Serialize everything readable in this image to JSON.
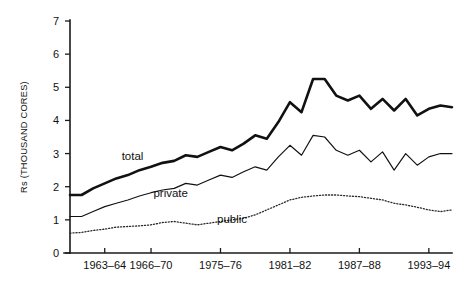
{
  "chart_data": {
    "type": "line",
    "title": "",
    "subtitle": "",
    "xlabel": "",
    "ylabel": "Rs (THOUSAND CORES)",
    "ylim": [
      0,
      7
    ],
    "yticks": [
      0,
      1,
      2,
      3,
      4,
      5,
      6,
      7
    ],
    "ytick_labels": [
      "0",
      "1",
      "2",
      "3",
      "4",
      "5",
      "6",
      "7"
    ],
    "xlim": [
      0,
      33
    ],
    "xtick_positions": [
      3,
      7,
      13,
      19,
      25,
      31
    ],
    "xtick_labels": [
      "1963–64",
      "1966–70",
      "1975–76",
      "1981–82",
      "1987–88",
      "1993–94"
    ],
    "grid": false,
    "legend_position": "inline-annotations",
    "annotations": [
      {
        "text": "total",
        "x": 5.4,
        "y": 2.82
      },
      {
        "text": "private",
        "x": 8.7,
        "y": 1.68
      },
      {
        "text": "public",
        "x": 14.0,
        "y": 0.92
      }
    ],
    "series": [
      {
        "name": "total",
        "style": "thick-solid",
        "color": "#111111",
        "x": [
          0,
          1,
          2,
          3,
          4,
          5,
          6,
          7,
          8,
          9,
          10,
          11,
          12,
          13,
          14,
          15,
          16,
          17,
          18,
          19,
          20,
          21,
          22,
          23,
          24,
          25,
          26,
          27,
          28,
          29,
          30,
          31,
          32,
          33
        ],
        "values": [
          1.75,
          1.75,
          1.95,
          2.1,
          2.25,
          2.35,
          2.5,
          2.6,
          2.72,
          2.78,
          2.95,
          2.9,
          3.05,
          3.2,
          3.1,
          3.3,
          3.55,
          3.45,
          3.95,
          4.55,
          4.25,
          5.25,
          5.25,
          4.75,
          4.6,
          4.75,
          4.35,
          4.65,
          4.3,
          4.65,
          4.15,
          4.35,
          4.45,
          4.4
        ]
      },
      {
        "name": "private",
        "style": "thin-solid",
        "color": "#111111",
        "x": [
          0,
          1,
          2,
          3,
          4,
          5,
          6,
          7,
          8,
          9,
          10,
          11,
          12,
          13,
          14,
          15,
          16,
          17,
          18,
          19,
          20,
          21,
          22,
          23,
          24,
          25,
          26,
          27,
          28,
          29,
          30,
          31,
          32,
          33
        ],
        "values": [
          1.1,
          1.1,
          1.25,
          1.4,
          1.5,
          1.6,
          1.72,
          1.82,
          1.9,
          1.95,
          2.1,
          2.05,
          2.2,
          2.35,
          2.28,
          2.45,
          2.6,
          2.5,
          2.9,
          3.25,
          2.95,
          3.55,
          3.5,
          3.1,
          2.95,
          3.1,
          2.75,
          3.05,
          2.5,
          3.0,
          2.65,
          2.9,
          3.0,
          3.0
        ]
      },
      {
        "name": "public",
        "style": "dotted",
        "color": "#2a2a2a",
        "x": [
          0,
          1,
          2,
          3,
          4,
          5,
          6,
          7,
          8,
          9,
          10,
          11,
          12,
          13,
          14,
          15,
          16,
          17,
          18,
          19,
          20,
          21,
          22,
          23,
          24,
          25,
          26,
          27,
          28,
          29,
          30,
          31,
          32,
          33
        ],
        "values": [
          0.6,
          0.62,
          0.68,
          0.72,
          0.78,
          0.8,
          0.82,
          0.85,
          0.92,
          0.95,
          0.9,
          0.85,
          0.9,
          0.95,
          1.0,
          1.05,
          1.15,
          1.3,
          1.45,
          1.6,
          1.68,
          1.72,
          1.75,
          1.75,
          1.72,
          1.7,
          1.65,
          1.6,
          1.5,
          1.45,
          1.38,
          1.3,
          1.25,
          1.3
        ]
      }
    ]
  },
  "plot_geometry": {
    "left": 70,
    "right": 452,
    "top": 21,
    "bottom": 253
  }
}
